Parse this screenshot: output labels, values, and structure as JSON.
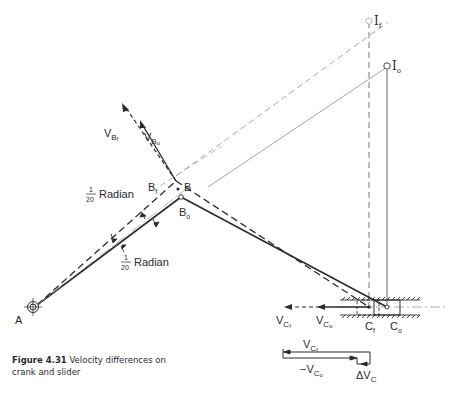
{
  "figure": {
    "number_label": "Figure 4.31",
    "caption_text": "Velocity differences on crank and slider",
    "points": {
      "A": "A",
      "B": "B",
      "Bf": "B",
      "Bf_sub": "f",
      "Bo": "B",
      "Bo_sub": "o",
      "If": "I",
      "If_sub": "f",
      "Io": "I",
      "Io_sub": "o",
      "Cf": "C",
      "Cf_sub": "f",
      "Co": "C",
      "Co_sub": "o"
    },
    "vectors": {
      "VBf": "V",
      "VBf_sub": "B",
      "VBf_subsub": "f",
      "VBo": "V",
      "VBo_sub": "B",
      "VBo_subsub": "o",
      "VCf": "V",
      "VCf_sub": "C",
      "VCf_subsub": "f",
      "VCo": "V",
      "VCo_sub": "C",
      "VCo_subsub": "o",
      "sum_VCf": "V",
      "sum_VCf_sub": "C",
      "sum_VCf_subsub": "f",
      "sum_neg_VCo": "−V",
      "sum_neg_VCo_sub": "C",
      "sum_neg_VCo_subsub": "o",
      "delta_VC": "ΔV",
      "delta_VC_sub": "C"
    },
    "angle_labels": {
      "upper_fraction_num": "1",
      "upper_fraction_den": "20",
      "upper_text": "Radian",
      "lower_fraction_num": "1",
      "lower_fraction_den": "20",
      "lower_text": "Radian"
    },
    "colors": {
      "ink": "#2b2b2b",
      "light_line": "#9a9a9a",
      "background": "#ffffff"
    }
  }
}
